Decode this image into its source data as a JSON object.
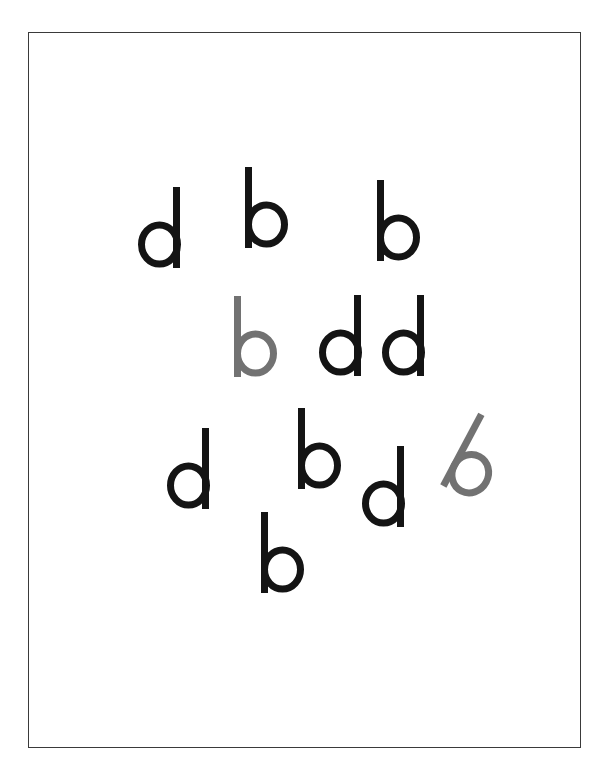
{
  "figure": {
    "frame": {
      "left": 28,
      "top": 32,
      "width": 553,
      "height": 716,
      "border_color": "#3a3a3a"
    },
    "colors": {
      "black": "#141414",
      "gray": "#727272"
    },
    "letters": [
      {
        "char": "d",
        "x": 137,
        "y": 187,
        "rotate": 0,
        "color": "black"
      },
      {
        "char": "b",
        "x": 244,
        "y": 167,
        "rotate": 0,
        "color": "black"
      },
      {
        "char": "b",
        "x": 376,
        "y": 180,
        "rotate": 0,
        "color": "black"
      },
      {
        "char": "b",
        "x": 233,
        "y": 296,
        "rotate": 0,
        "color": "gray"
      },
      {
        "char": "d",
        "x": 318,
        "y": 295,
        "rotate": 0,
        "color": "black"
      },
      {
        "char": "d",
        "x": 381,
        "y": 295,
        "rotate": 0,
        "color": "black"
      },
      {
        "char": "d",
        "x": 166,
        "y": 428,
        "rotate": 0,
        "color": "black"
      },
      {
        "char": "b",
        "x": 297,
        "y": 408,
        "rotate": 0,
        "color": "black"
      },
      {
        "char": "d",
        "x": 361,
        "y": 446,
        "rotate": 0,
        "color": "black"
      },
      {
        "char": "b",
        "x": 452,
        "y": 417,
        "rotate": 28,
        "color": "gray"
      },
      {
        "char": "b",
        "x": 260,
        "y": 512,
        "rotate": 0,
        "color": "black"
      }
    ]
  }
}
